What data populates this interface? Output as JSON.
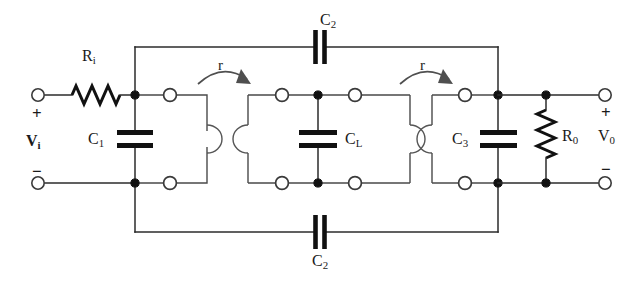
{
  "diagram": {
    "type": "electronic-schematic",
    "background_color": "#ffffff",
    "line_color": "#2b2b2b"
  },
  "input_port": {
    "source_label": "V",
    "source_sub": "i",
    "plus_sign": "+",
    "minus_sign": "−"
  },
  "output_port": {
    "load_label": "V",
    "load_sub": "0",
    "plus_sign": "+",
    "minus_sign": "−"
  },
  "components": {
    "source_resistor": {
      "label": "R",
      "sub": "i"
    },
    "load_resistor": {
      "label": "R",
      "sub": "0"
    },
    "cap1": {
      "label": "C",
      "sub": "1"
    },
    "capL": {
      "label": "C",
      "sub": "L"
    },
    "cap3": {
      "label": "C",
      "sub": "3"
    },
    "cap2_top": {
      "label": "C",
      "sub": "2"
    },
    "cap2_bottom": {
      "label": "C",
      "sub": "2"
    }
  },
  "couplings": [
    {
      "label": "r",
      "position": "left"
    },
    {
      "label": "r",
      "position": "right"
    }
  ]
}
